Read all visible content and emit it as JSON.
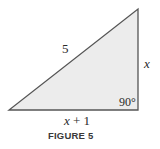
{
  "figure": {
    "caption": "FIGURE 5",
    "shape": "right-triangle",
    "colors": {
      "fill": "#ececec",
      "stroke": "#555555",
      "text": "#2a2a2a"
    },
    "vertices": {
      "bottom_left": [
        9,
        110
      ],
      "bottom_right": [
        138,
        110
      ],
      "top_right": [
        138,
        9
      ]
    },
    "labels": {
      "hypotenuse": "5",
      "vertical_leg": "x",
      "base_var": "x",
      "base_rest": " + 1",
      "right_angle": "90°"
    }
  }
}
